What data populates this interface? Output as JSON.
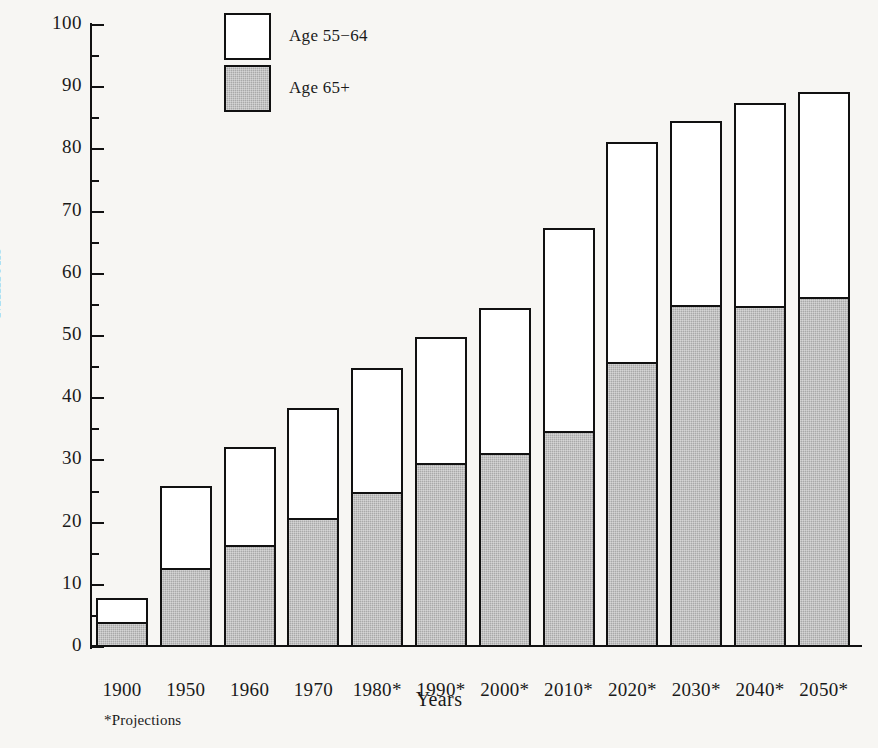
{
  "chart_data": {
    "type": "bar",
    "stacked": true,
    "title": "",
    "xlabel": "Years",
    "ylabel": "Millions",
    "ylim": [
      0,
      100
    ],
    "ytick_step": 10,
    "yminor_step": 5,
    "grid": false,
    "legend_position": "top-left-inside",
    "categories": [
      "1900",
      "1950",
      "1960",
      "1970",
      "1980*",
      "1990*",
      "2000*",
      "2010*",
      "2020*",
      "2030*",
      "2040*",
      "2050*"
    ],
    "ytick_labels": [
      "0",
      "10",
      "20",
      "30",
      "40",
      "50",
      "60",
      "70",
      "80",
      "90",
      "100"
    ],
    "series": [
      {
        "name": "Age 65+",
        "color": "#a9a9a9",
        "values": [
          3.3,
          12.1,
          15.8,
          20.1,
          24.3,
          29.0,
          30.5,
          34.1,
          45.1,
          54.4,
          54.2,
          55.7
        ]
      },
      {
        "name": "Age 55−64",
        "color": "#ffffff",
        "values": [
          4.5,
          13.8,
          16.4,
          18.4,
          20.6,
          20.8,
          24.0,
          33.2,
          36.1,
          30.2,
          33.3,
          33.5
        ]
      }
    ],
    "totals": [
      7.8,
      25.9,
      32.2,
      38.5,
      44.9,
      49.8,
      54.5,
      67.3,
      81.2,
      84.6,
      87.5,
      89.2
    ],
    "annotations": [
      "*Projections"
    ]
  },
  "legend": {
    "entries": [
      {
        "label": "Age 55−64",
        "swatch": "white"
      },
      {
        "label": "Age 65+",
        "swatch": "gray"
      }
    ]
  },
  "axes": {
    "y_title": "Millions",
    "x_title": "Years"
  },
  "footnote": "*Projections"
}
